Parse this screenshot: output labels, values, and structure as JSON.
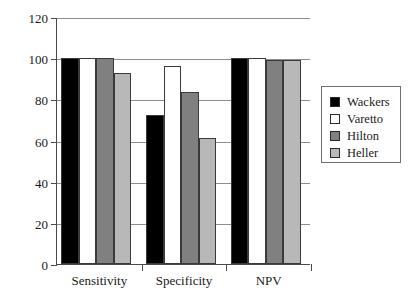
{
  "chart_data": {
    "type": "bar",
    "title": "",
    "subtitle": "",
    "xlabel": "",
    "ylabel": "",
    "categories": [
      "Sensitivity",
      "Specificity",
      "NPV"
    ],
    "series": [
      {
        "name": "Wackers",
        "color": "#000000",
        "values": [
          100,
          72.5,
          100
        ]
      },
      {
        "name": "Varetto",
        "color": "#ffffff",
        "values": [
          100,
          96,
          100
        ]
      },
      {
        "name": "Hilton",
        "color": "#808080",
        "values": [
          100,
          83.5,
          99
        ]
      },
      {
        "name": "Heller",
        "color": "#b8b8b8",
        "values": [
          93,
          61,
          99
        ]
      }
    ],
    "ylim": [
      0,
      120
    ],
    "yticks": [
      0,
      20,
      40,
      60,
      80,
      100,
      120
    ],
    "ytick_labels": [
      "0",
      "20",
      "40",
      "60",
      "80",
      "100",
      "120"
    ],
    "grid": true,
    "grid_axis": "y",
    "legend_position": "right",
    "axis_color": "#4a4a4a",
    "grid_color": "#8e8e8e",
    "background_color": "#ffffff"
  },
  "legend": {
    "items": [
      {
        "label": "Wackers",
        "swatch": "#000000"
      },
      {
        "label": "Varetto",
        "swatch": "#ffffff"
      },
      {
        "label": "Hilton",
        "swatch": "#808080"
      },
      {
        "label": "Heller",
        "swatch": "#b8b8b8"
      }
    ]
  }
}
